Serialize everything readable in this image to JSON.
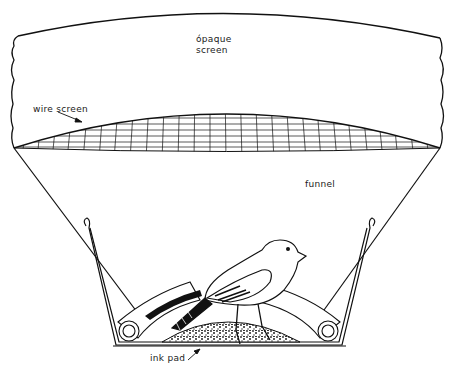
{
  "diagram": {
    "labels": {
      "opaque_screen_line1": "ópaque",
      "opaque_screen_line2": "screen",
      "wire_screen": "wire screen",
      "funnel": "funnel",
      "ink_pad": "ink pad"
    },
    "components": [
      "opaque screen",
      "wire screen",
      "funnel",
      "bird",
      "ink pad",
      "rollers",
      "frame"
    ],
    "colors": {
      "line": "#111111",
      "background": "#ffffff"
    }
  }
}
